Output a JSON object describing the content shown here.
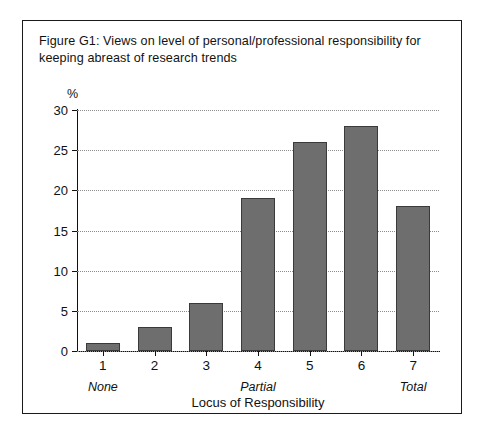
{
  "figure": {
    "title": "Figure G1: Views on level of personal/professional responsibility for keeping abreast of research trends",
    "frame_color": "#1a1a1a",
    "bar_fill": "#6e6e6e",
    "bar_stroke": "#3a3a3a",
    "grid_color": "#8d8d8d"
  },
  "chart_data": {
    "type": "bar",
    "title": "Figure G1: Views on level of personal/professional responsibility for keeping abreast of research trends",
    "categories": [
      "1",
      "2",
      "3",
      "4",
      "5",
      "6",
      "7"
    ],
    "values": [
      1,
      3,
      6,
      19,
      26,
      28,
      18
    ],
    "xlabel": "Locus of Responsibility",
    "ylabel": "%",
    "ylim": [
      0,
      30
    ],
    "yticks": [
      0,
      5,
      10,
      15,
      20,
      25,
      30
    ],
    "ytick_labels": [
      "0",
      "5",
      "10",
      "15",
      "20",
      "25",
      "30"
    ],
    "grid": true,
    "grid_axis": "y",
    "legend": null,
    "annotations": [
      {
        "text": "None",
        "at_category": "1",
        "style": "italic",
        "position": "below-axis"
      },
      {
        "text": "Partial",
        "at_category": "4",
        "style": "italic",
        "position": "below-axis"
      },
      {
        "text": "Total",
        "at_category": "7",
        "style": "italic",
        "position": "below-axis"
      }
    ]
  }
}
